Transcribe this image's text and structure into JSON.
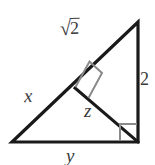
{
  "figure": {
    "type": "geometry-diagram",
    "background_color": "#ffffff",
    "stroke_color": "#1a1a1a",
    "marker_color": "#8a8a8a",
    "label_color": "#3a3a3a"
  },
  "labels": {
    "hypotenuse_upper": "√2",
    "radical_sign": "√",
    "radicand": "2",
    "vertical_side": "2",
    "hypotenuse_lower": "x",
    "altitude_segment": "z",
    "base_side": "y"
  },
  "geometry": {
    "vertices": {
      "apex": [
        138,
        22
      ],
      "bottom_left": [
        12,
        142
      ],
      "bottom_right": [
        138,
        142
      ],
      "altitude_foot": [
        75,
        88
      ]
    },
    "edges": [
      {
        "name": "left-slant-side",
        "from": [
          12,
          142
        ],
        "to": [
          138,
          22
        ],
        "label": "x / √2"
      },
      {
        "name": "right-vertical-side",
        "from": [
          138,
          22
        ],
        "to": [
          138,
          142
        ],
        "label": "2"
      },
      {
        "name": "bottom-base-side",
        "from": [
          12,
          142
        ],
        "to": [
          138,
          142
        ],
        "label": "y"
      },
      {
        "name": "inner-altitude-segment",
        "from": [
          75,
          88
        ],
        "to": [
          138,
          142
        ],
        "label": "z"
      }
    ],
    "right_angle_markers": [
      {
        "name": "altitude-foot-right-angle",
        "at": [
          75,
          88
        ],
        "rotated": true
      },
      {
        "name": "bottom-right-right-angle",
        "at": [
          138,
          142
        ],
        "rotated": false
      }
    ]
  }
}
